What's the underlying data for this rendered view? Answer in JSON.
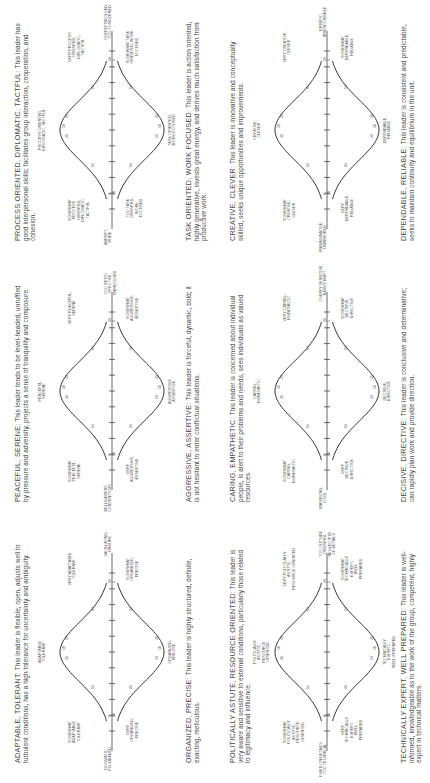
{
  "percentile_marks": [
    "1",
    "16",
    "31",
    "50",
    "69",
    "84",
    "99"
  ],
  "panels": [
    {
      "id": "adaptable",
      "left_pole": "DOGMATIC,\nPIG-HEADED",
      "right_pole": "VACILLATING,\nUNSURE",
      "top_peak": "ADAPTABLE\nTOLERANT",
      "top_left": "SOMEWHAT\nADAPTABLE\nTOLERANT",
      "top_right": "VERY ADAPTABLE\nTOLERANT",
      "bottom_peak": "ORGANIZED,\nPRECISE",
      "bottom_left": "VERY\nORGANIZED,\nPRECISE",
      "bottom_right": "SOMEWHAT\nORGANIZED,\nPRECISE",
      "top_desc_head": "ADAPTABLE, TOLERANT:",
      "top_desc": "This leader is flexible, open, adjusts well to turbulent conditions, has a high tolerance for uncertainty and ambiguity.",
      "bottom_desc_head": "ORGANIZED, PRECISE:",
      "bottom_desc": "This leader is highly structured, definite, exacting, meticulous."
    },
    {
      "id": "peaceful",
      "left_pole": "BELLIGERENT,\nCONTENTIOUS",
      "right_pole": "TOO INTRO-\nSPECTIVE,\nUNINVOLVED",
      "top_peak": "PEACEFUL,\nSERENE",
      "top_left": "SOMEWHAT\nPEACEFUL,\nSERENE",
      "top_right": "VERY PEACEFUL,\nSERENE",
      "bottom_peak": "AGGRESSIVE,\nASSERTIVE",
      "bottom_left": "VERY\nAGGRESSIVE,\nASSERTIVE",
      "bottom_right": "SOMEWHAT\nAGGRESSIVE,\nASSERTIVE",
      "top_desc_head": "PEACEFUL, SERENE:",
      "top_desc": "This leader tends to be level-headed, unruffled by pressure and adversity, projects a sense of tranquility and composure.",
      "bottom_desc_head": "AGGRESSIVE, ASSERTIVE:",
      "bottom_desc": "This leader is forceful, dynamic, bold; it is not hesitant to enter conflictual situations."
    },
    {
      "id": "process",
      "left_pole": "ABRUPT,\nRUDE",
      "right_pole": "OVERLY INVOLVED,\nTOO CONCERNED",
      "top_peak": "PROCESS ORIENTED,\nDIPLOMATIC, TACTFUL",
      "top_left": "SOMEWHAT\nPROCESS\nORIENTED,\nDIPLOMATIC,\nTACTFUL",
      "top_right": "VERY PROCESS\nORIENTED,\nDIPLOMATIC,\nTACTFUL",
      "bottom_peak": "TASK ORIENTED,\nWORK FOCUSED",
      "bottom_left": "TOO TASK\nORIENTED,\nWORK\nFOCUSED",
      "bottom_right": "SOMEWHAT TASK\nORIENTED, WORK\nFOCUSED",
      "top_desc_head": "PROCESS ORIENTED, DIPLOMATIC, TACTFUL:",
      "top_desc": "This leader has good interpersonal skills; facilitates group interaction, cooperation, and cohesion.",
      "bottom_desc_head": "TASK ORIENTED, WORK FOCUSED:",
      "bottom_desc": "This leader is action oriented, highly generative, invests great energy, and derives much satisfaction from productive work."
    },
    {
      "id": "political",
      "left_pole": "FIXED ON DETAILS,\nTOO TECHNICAL",
      "right_pole": "TOO OUTSIDE\nORIENTED,\nNEGLECTFUL\nOF DETAILS",
      "top_peak": "POLITICALLY\nASTUTE,\nRESOURCE\nORIENTED",
      "top_left": "SOMEWHAT\nPOLITICALLY\nASTUTE,\nRESOURCE\nORIENTED",
      "top_right": "VERY POLITICALLY\nASTUTE,\nRESOURCE ORIENTED",
      "bottom_peak": "TECHNICALLY\nEXPERT,\nWELL-PREPARED",
      "bottom_left": "VERY\nTECHNICALLY\nEXPERT,\nWELL\nPREPARED",
      "bottom_right": "SOMEWHAT\nTECHNICALLY\nEXPERT,\nWELL\nPREPARED",
      "top_desc_head": "POLITICALLY ASTUTE, RESOURCE ORIENTED:",
      "top_desc": "This leader is very aware and sensitive to external conditions, particularly those related to legitimacy and influence.",
      "bottom_desc_head": "TECHNICALLY EXPERT, WELL PREPARED:",
      "bottom_desc": "This leader is well-informed, knowledgeable as to the work of the group, competent, highly expert in technical matters."
    },
    {
      "id": "caring",
      "left_pole": "UNFEELING,\nCOLD",
      "right_pole": "OVERLY SENSITIVE,\nEASILY HURT",
      "top_peak": "CARING,\nEMPATHETIC",
      "top_left": "SOMEWHAT\nCARING,\nEMPATHETIC",
      "top_right": "VERY CARING,\nEMPATHETIC",
      "bottom_peak": "DECISIVE,\nDIRECTIVE",
      "bottom_left": "VERY\nDECISIVE,\nDIRECTIVE",
      "bottom_right": "SOMEWHAT\nDECISIVE,\nDIRECTIVE",
      "top_desc_head": "CARING, EMPATHETIC:",
      "top_desc": "This leader is concerned about individual people, is alert to their problems and needs, sees individuals as valued resources.",
      "bottom_desc_head": "DECISIVE, DIRECTIVE:",
      "bottom_desc": "This leader is conclusive and determinative; can rapidly plan work and provide direction."
    },
    {
      "id": "creative",
      "left_pole": "UNIMAGINATIVE,\nUNINSPIRED",
      "right_pole": "ERRATIC,\nIRRESPONSIBLE",
      "top_peak": "CREATIVE,\nCLEVER",
      "top_left": "SOMEWHAT\nCREATIVE,\nCLEVER",
      "top_right": "VERY CREATIVE,\nCLEVER",
      "bottom_peak": "DEPENDABLE,\nRELIABLE",
      "bottom_left": "VERY\nDEPENDABLE,\nRELIABLE",
      "bottom_right": "SOMEWHAT\nDEPENDABLE,\nRELIABLE",
      "top_desc_head": "CREATIVE, CLEVER:",
      "top_desc": "This leader is innovative and conceptually skilled, seeks unique opportunities and improvements.",
      "bottom_desc_head": "DEPENDABLE, RELIABLE:",
      "bottom_desc": "This leader is consistent and predictable, seeks to maintain continuity and equilibrium in the unit."
    }
  ]
}
